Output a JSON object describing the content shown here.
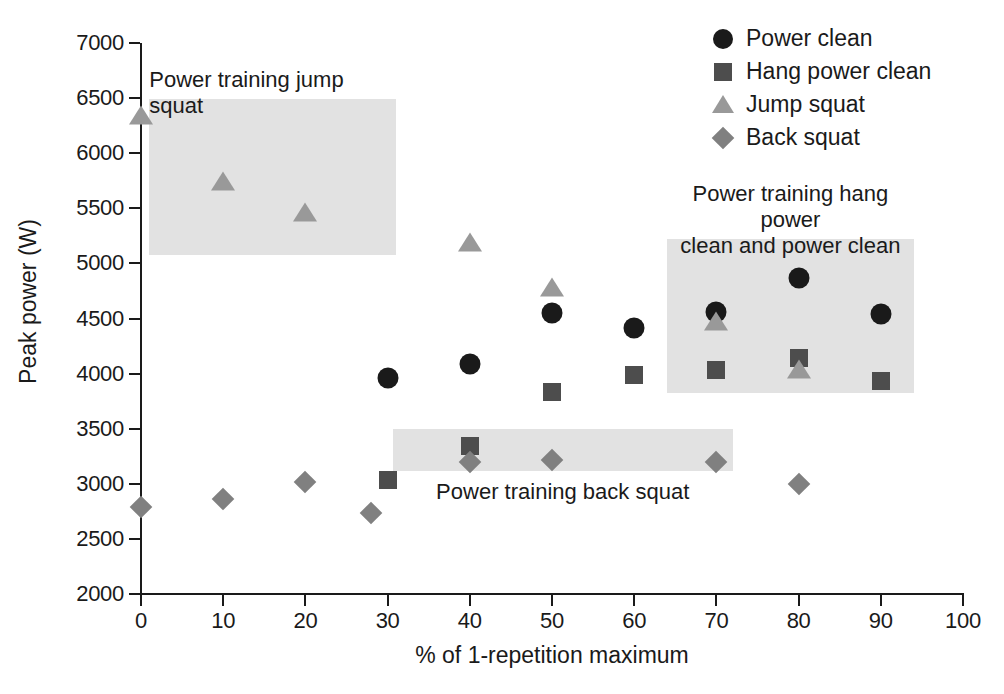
{
  "chart_data": {
    "type": "scatter",
    "title": "",
    "xlabel": "% of 1-repetition maximum",
    "ylabel": "Peak power (W)",
    "xlim": [
      0,
      100
    ],
    "ylim": [
      2000,
      7000
    ],
    "xticks": [
      "0",
      "10",
      "20",
      "30",
      "40",
      "50",
      "60",
      "70",
      "80",
      "90",
      "100"
    ],
    "yticks": [
      "2000",
      "2500",
      "3000",
      "3500",
      "4000",
      "4500",
      "5000",
      "5500",
      "6000",
      "6500",
      "7000"
    ],
    "grid": false,
    "legend_position": "top-right",
    "series": [
      {
        "name": "Power clean",
        "marker": "circle",
        "color": "#1a1a1a",
        "points": [
          {
            "x": 30,
            "y": 3960
          },
          {
            "x": 40,
            "y": 4090
          },
          {
            "x": 50,
            "y": 4550
          },
          {
            "x": 60,
            "y": 4410
          },
          {
            "x": 70,
            "y": 4560
          },
          {
            "x": 80,
            "y": 4870
          },
          {
            "x": 90,
            "y": 4545
          }
        ]
      },
      {
        "name": "Hang power clean",
        "marker": "square",
        "color": "#4d4d4d",
        "points": [
          {
            "x": 30,
            "y": 3030
          },
          {
            "x": 40,
            "y": 3340
          },
          {
            "x": 50,
            "y": 3830
          },
          {
            "x": 60,
            "y": 3985
          },
          {
            "x": 70,
            "y": 4030
          },
          {
            "x": 80,
            "y": 4145
          },
          {
            "x": 90,
            "y": 3935
          }
        ]
      },
      {
        "name": "Jump squat",
        "marker": "triangle",
        "color": "#999999",
        "points": [
          {
            "x": 0,
            "y": 6330
          },
          {
            "x": 10,
            "y": 5730
          },
          {
            "x": 20,
            "y": 5450
          },
          {
            "x": 40,
            "y": 5180
          },
          {
            "x": 50,
            "y": 4770
          },
          {
            "x": 70,
            "y": 4455
          },
          {
            "x": 80,
            "y": 4020
          }
        ]
      },
      {
        "name": "Back squat",
        "marker": "diamond",
        "color": "#808080",
        "points": [
          {
            "x": 0,
            "y": 2790
          },
          {
            "x": 10,
            "y": 2860
          },
          {
            "x": 20,
            "y": 3015
          },
          {
            "x": 28,
            "y": 2735
          },
          {
            "x": 40,
            "y": 3200
          },
          {
            "x": 50,
            "y": 3215
          },
          {
            "x": 70,
            "y": 3195
          },
          {
            "x": 80,
            "y": 3000
          }
        ]
      }
    ],
    "highlight_regions": [
      {
        "name": "power-training-jump-squat",
        "label": "Power training jump squat",
        "label_position": "above",
        "color": "#e2e2e2",
        "x_range": [
          1,
          31
        ],
        "y_range": [
          5080,
          6490
        ]
      },
      {
        "name": "power-training-back-squat",
        "label": "Power training back squat",
        "label_position": "below",
        "color": "#e2e2e2",
        "x_range": [
          30.6,
          72
        ],
        "y_range": [
          3120,
          3495
        ]
      },
      {
        "name": "power-training-hang-power-clean-and-power-clean",
        "label": "Power training hang power\nclean and power clean",
        "label_position": "above",
        "color": "#e2e2e2",
        "x_range": [
          64,
          94
        ],
        "y_range": [
          3820,
          5220
        ]
      }
    ],
    "legend": [
      {
        "label": "Power clean",
        "marker": "circle",
        "color": "#1a1a1a"
      },
      {
        "label": "Hang power clean",
        "marker": "square",
        "color": "#4d4d4d"
      },
      {
        "label": "Jump squat",
        "marker": "triangle",
        "color": "#999999"
      },
      {
        "label": "Back squat",
        "marker": "diamond",
        "color": "#808080"
      }
    ]
  }
}
